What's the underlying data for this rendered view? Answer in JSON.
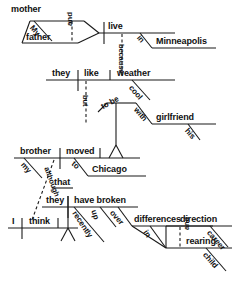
{
  "diagram": {
    "type": "reed-kellogg-sentence-diagram",
    "ink_color": "#1a1a1a",
    "background_color": "#ffffff",
    "sentence": "My mother and father live in Minneapolis because they like cool weather, but to be with his girlfriend my brother moved to Chicago although I think they have broken up recently over differences in direction and child rearing career.",
    "clauses": [
      {
        "id": "clause-1",
        "subject_compound": {
          "head_1": "mother",
          "modifier_1": "My",
          "conjunction": "and",
          "head_2": "father"
        },
        "verb": "live",
        "modifiers": [
          {
            "preposition": "in",
            "object": "Minneapolis"
          }
        ]
      },
      {
        "id": "clause-2",
        "subordinator": "because",
        "subject": "they",
        "verb": "like",
        "object": "weather",
        "object_modifier": "cool"
      },
      {
        "id": "clause-3",
        "conjunction": "but",
        "infinitive": "to be",
        "infinitive_modifier": {
          "preposition": "with",
          "object": "girlfriend",
          "object_modifier": "his"
        },
        "subject": "brother",
        "subject_modifier": "my",
        "verb": "moved",
        "modifiers": [
          {
            "preposition": "to",
            "object": "Chicago"
          }
        ]
      },
      {
        "id": "clause-4",
        "subordinator": "although",
        "subject": "I",
        "verb": "think",
        "complementizer": "that"
      },
      {
        "id": "clause-5",
        "subject": "they",
        "verb": "have broken",
        "adverb_1": "up",
        "adverb_2": "recently",
        "modifiers": [
          {
            "preposition": "over",
            "object": "differences",
            "nested": {
              "preposition": "in",
              "object_1": "direction",
              "object_1_modifier": "career",
              "conjunction": "and",
              "object_2": "rearing",
              "object_2_modifier": "child"
            }
          }
        ]
      }
    ],
    "words": {
      "mother": "mother",
      "my_1": "My",
      "and_1": "and",
      "father": "father",
      "live": "live",
      "in_1": "in",
      "minneapolis": "Minneapolis",
      "because": "because",
      "they_1": "they",
      "like": "like",
      "weather": "weather",
      "cool": "cool",
      "but": "but",
      "to_be": "to be",
      "with": "with",
      "girlfriend": "girlfriend",
      "his": "his",
      "brother": "brother",
      "my_2": "my",
      "moved": "moved",
      "to": "to",
      "chicago": "Chicago",
      "although": "although",
      "that": "that",
      "they_2": "they",
      "have_broken": "have broken",
      "i": "I",
      "think": "think",
      "up": "up",
      "recently": "recently",
      "over": "over",
      "differences": "differences",
      "in_2": "in",
      "direction": "direction",
      "career": "career",
      "and_2": "and",
      "rearing": "rearing",
      "child": "child"
    }
  }
}
